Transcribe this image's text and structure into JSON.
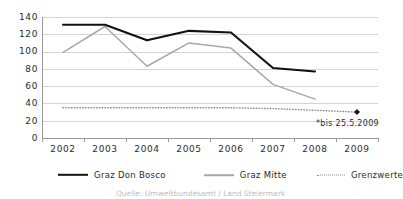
{
  "chart_data": {
    "type": "line",
    "title": "",
    "xlabel": "",
    "ylabel": "",
    "categories": [
      "2002",
      "2003",
      "2004",
      "2005",
      "2006",
      "2007",
      "2008",
      "2009"
    ],
    "ylim": [
      0,
      140
    ],
    "ytick_step": 20,
    "yticks": [
      "140",
      "120",
      "100",
      "80",
      "60",
      "40",
      "20",
      "0"
    ],
    "grid": true,
    "legend_position": "bottom",
    "series": [
      {
        "name": "Graz Don Bosco",
        "color": "#111111",
        "style": "solid",
        "values": [
          131,
          131,
          113,
          124,
          122,
          81,
          77,
          null
        ]
      },
      {
        "name": "Graz Mitte",
        "color": "#a8a8a8",
        "style": "solid",
        "values": [
          99,
          129,
          83,
          110,
          104,
          62,
          45,
          null
        ]
      },
      {
        "name": "Grenzwerte",
        "color": "#8d8d8d",
        "style": "dotted",
        "values": [
          35,
          35,
          35,
          35,
          35,
          34,
          32,
          30
        ]
      }
    ],
    "markers": [
      {
        "name": "grenzwerte-2009-point",
        "category": "2009",
        "value": 30
      }
    ],
    "annotations": [
      {
        "name": "footnote-bis",
        "text": "*bis 25.5.2009"
      }
    ]
  },
  "legend": {
    "items": [
      {
        "label": "Graz Don Bosco",
        "swatch": "solid-black-line-icon"
      },
      {
        "label": "Graz Mitte",
        "swatch": "solid-gray-line-icon"
      },
      {
        "label": "Grenzwerte",
        "swatch": "dotted-gray-line-icon"
      }
    ]
  },
  "caption": {
    "text": "Quelle: Umweltbundesamt / Land Steiermark"
  }
}
